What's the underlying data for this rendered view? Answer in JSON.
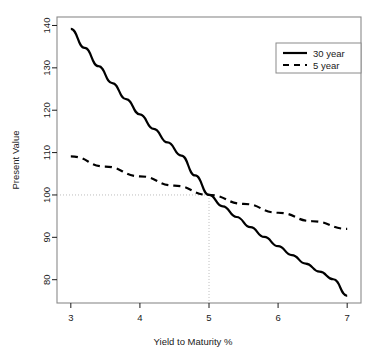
{
  "chart_data": {
    "type": "line",
    "title": "",
    "xlabel": "Yield to Maturity %",
    "ylabel": "Present Value",
    "xlim": [
      2.8,
      7.2
    ],
    "ylim": [
      74.5,
      142
    ],
    "xticks": [
      3,
      4,
      5,
      6,
      7
    ],
    "xtick_labels": [
      "3",
      "4",
      "5",
      "6",
      "7"
    ],
    "yticks": [
      80,
      90,
      100,
      110,
      120,
      130,
      140
    ],
    "ytick_labels": [
      "80",
      "90",
      "100",
      "110",
      "120",
      "130",
      "140"
    ],
    "grid": false,
    "legend_position": "top-right",
    "annotations": {
      "reference_lines": {
        "horizontal_value": 100,
        "vertical_value": 5,
        "style": "dotted",
        "color": "#bdbdbd"
      }
    },
    "series": [
      {
        "name": "30 year",
        "style": "solid",
        "color": "#000000",
        "width": 2.2,
        "x": [
          3.0,
          3.2,
          3.4,
          3.6,
          3.8,
          4.0,
          4.2,
          4.4,
          4.6,
          4.8,
          5.0,
          5.2,
          5.4,
          5.6,
          5.8,
          6.0,
          6.2,
          6.4,
          6.6,
          6.8,
          7.0
        ],
        "y": [
          139.2,
          134.7,
          130.4,
          126.4,
          122.6,
          119.0,
          115.6,
          112.4,
          109.3,
          104.6,
          100.0,
          97.3,
          94.8,
          92.4,
          90.1,
          87.9,
          85.8,
          83.8,
          81.9,
          80.1,
          76.2
        ]
      },
      {
        "name": "5 year",
        "style": "dashed",
        "color": "#000000",
        "width": 2.2,
        "x": [
          3.0,
          3.5,
          4.0,
          4.5,
          5.0,
          5.5,
          6.0,
          6.5,
          7.0
        ],
        "y": [
          109.1,
          106.7,
          104.4,
          102.2,
          100.0,
          97.9,
          95.8,
          93.8,
          92.0
        ]
      }
    ],
    "legend": [
      {
        "label": "30 year",
        "style": "solid"
      },
      {
        "label": "5 year",
        "style": "dashed"
      }
    ]
  },
  "colors": {
    "axis": "#1a1a1a",
    "frame": "#7a7a7a",
    "line": "#000000",
    "reference": "#c9c9c9",
    "background": "#ffffff"
  }
}
